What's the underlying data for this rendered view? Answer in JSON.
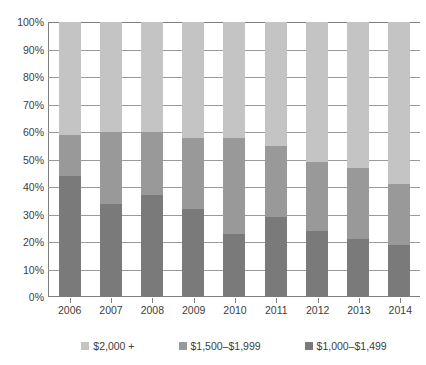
{
  "chart_data": {
    "type": "bar",
    "stacked": true,
    "stack_mode": "percent",
    "title": "",
    "xlabel": "",
    "ylabel": "",
    "ylim": [
      0,
      100
    ],
    "yticks": [
      "0%",
      "10%",
      "20%",
      "30%",
      "40%",
      "50%",
      "60%",
      "70%",
      "80%",
      "90%",
      "100%"
    ],
    "ytick_values": [
      0,
      10,
      20,
      30,
      40,
      50,
      60,
      70,
      80,
      90,
      100
    ],
    "grid": true,
    "legend_position": "bottom",
    "categories": [
      "2006",
      "2007",
      "2008",
      "2009",
      "2010",
      "2011",
      "2012",
      "2013",
      "2014"
    ],
    "series": [
      {
        "name": "$1,000–$1,499",
        "color": "#7a7a7a",
        "values": [
          44,
          34,
          37,
          32,
          23,
          29,
          24,
          21,
          19
        ]
      },
      {
        "name": "$1,500–$1,999",
        "color": "#999999",
        "values": [
          15,
          26,
          23,
          26,
          35,
          26,
          25,
          26,
          22
        ]
      },
      {
        "name": "$2,000 +",
        "color": "#c4c4c4",
        "values": [
          41,
          40,
          40,
          42,
          42,
          45,
          51,
          53,
          59
        ]
      }
    ],
    "cumulative_tops": {
      "2006": [
        44,
        59,
        100
      ],
      "2007": [
        34,
        60,
        100
      ],
      "2008": [
        37,
        60,
        100
      ],
      "2009": [
        32,
        58,
        100
      ],
      "2010": [
        23,
        58,
        100
      ],
      "2011": [
        29,
        55,
        100
      ],
      "2012": [
        24,
        49,
        100
      ],
      "2013": [
        21,
        47,
        100
      ],
      "2014": [
        19,
        41,
        100
      ]
    }
  },
  "legend": {
    "items": [
      {
        "label": "$2,000 +",
        "color": "#c4c4c4"
      },
      {
        "label": "$1,500–$1,999",
        "color": "#999999"
      },
      {
        "label": "$1,000–$1,499",
        "color": "#7a7a7a"
      }
    ]
  },
  "colors": {
    "axis": "#7f7f7f",
    "grid": "#9a9a9a",
    "text": "#3d3d3d",
    "background": "#ffffff"
  }
}
